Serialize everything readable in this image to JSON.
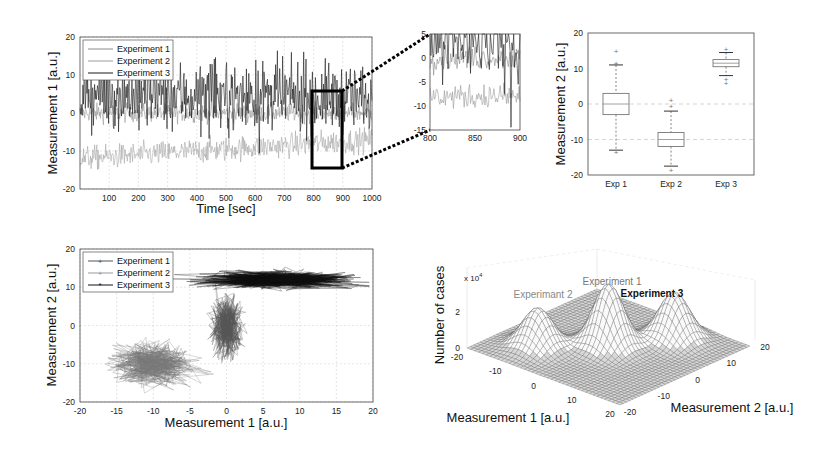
{
  "chart_data": [
    {
      "id": "timeseries",
      "type": "line",
      "title": "",
      "xlabel": "Time [sec]",
      "ylabel": "Measurement 1 [a.u.]",
      "xlim": [
        0,
        1000
      ],
      "ylim": [
        -20,
        20
      ],
      "xticks": [
        100,
        200,
        300,
        400,
        500,
        600,
        700,
        800,
        900,
        1000
      ],
      "yticks": [
        -20,
        -10,
        0,
        10,
        20
      ],
      "grid": true,
      "legend_position": "upper-left",
      "series": [
        {
          "name": "Experiment 1",
          "mean": 0,
          "noise": 1.2,
          "trend": 0,
          "color": "#8a8a8a"
        },
        {
          "name": "Experiment 2",
          "mean": -12,
          "noise": 1.6,
          "trend": 5,
          "color": "#9a9a9a"
        },
        {
          "name": "Experiment 3",
          "mean": 5,
          "noise": 4.5,
          "trend": -1,
          "color": "#1a1a1a"
        }
      ],
      "zoom_rectangle": {
        "x": [
          800,
          900
        ],
        "y": [
          -15,
          5
        ]
      }
    },
    {
      "id": "inset",
      "type": "line",
      "title": "",
      "xlim": [
        800,
        900
      ],
      "ylim": [
        -15,
        5
      ],
      "xticks": [
        800,
        850,
        900
      ],
      "yticks": [
        -15,
        -10,
        -5,
        0,
        5
      ],
      "grid": false,
      "series": [
        {
          "name": "Experiment 1",
          "mean": 0,
          "noise": 1.2,
          "color": "#8a8a8a"
        },
        {
          "name": "Experiment 2",
          "mean": -8,
          "noise": 1.3,
          "color": "#9a9a9a"
        },
        {
          "name": "Experiment 3",
          "mean": 4,
          "noise": 4.5,
          "color": "#1a1a1a"
        }
      ]
    },
    {
      "id": "boxplot",
      "type": "box",
      "xlabel": "",
      "ylabel": "Measurement 2 [a.u.]",
      "ylim": [
        -20,
        20
      ],
      "yticks": [
        -20,
        -10,
        0,
        10,
        20
      ],
      "categories": [
        "Exp 1",
        "Exp 2",
        "Exp 3"
      ],
      "boxes": [
        {
          "label": "Exp 1",
          "whisker_low": -13,
          "q1": -3,
          "median": 0,
          "q3": 3,
          "whisker_high": 11,
          "outliers": [
            15,
            11.5,
            -13.5
          ]
        },
        {
          "label": "Exp 2",
          "whisker_low": -17.5,
          "q1": -12,
          "median": -10,
          "q3": -8,
          "whisker_high": -2,
          "outliers": [
            1,
            -0.5,
            -18.5
          ]
        },
        {
          "label": "Exp 3",
          "whisker_low": 8,
          "q1": 10.5,
          "median": 11.5,
          "q3": 12.5,
          "whisker_high": 14.5,
          "outliers": [
            15.5,
            7,
            6
          ]
        }
      ],
      "grid": "dashed horizontal at 0 and -10"
    },
    {
      "id": "scatter",
      "type": "scatter",
      "xlabel": "Measurement 1 [a.u.]",
      "ylabel": "Measurement 2 [a.u.]",
      "xlim": [
        -20,
        20
      ],
      "ylim": [
        -20,
        20
      ],
      "xticks": [
        -20,
        -15,
        -10,
        -5,
        0,
        5,
        10,
        15,
        20
      ],
      "yticks": [
        -20,
        -10,
        0,
        10,
        20
      ],
      "grid": true,
      "legend_position": "upper-left",
      "series": [
        {
          "name": "Experiment 1",
          "cx": 0,
          "cy": 0,
          "sx": 1.0,
          "sy": 4,
          "color": "#555555"
        },
        {
          "name": "Experiment 2",
          "cx": -10,
          "cy": -10,
          "sx": 2.8,
          "sy": 2.8,
          "color": "#777777"
        },
        {
          "name": "Experiment 3",
          "cx": 7,
          "cy": 12,
          "sx": 5,
          "sy": 1.1,
          "color": "#111111"
        }
      ]
    },
    {
      "id": "histogram3d",
      "type": "surface",
      "xlabel": "Measurement 1 [a.u.]",
      "ylabel": "Measurement 2 [a.u.]",
      "zlabel": "Number of cases",
      "z_multiplier": "x 10^4",
      "xticks": [
        -20,
        -10,
        0,
        10,
        20
      ],
      "yticks": [
        -20,
        -10,
        0,
        10,
        20
      ],
      "zticks": [
        0,
        2
      ],
      "annotations": [
        {
          "text": "Experiment 1",
          "style": "gray"
        },
        {
          "text": "Experimant 2",
          "style": "gray"
        },
        {
          "text": "Experiment 3",
          "style": "bold"
        }
      ],
      "peaks": [
        {
          "name": "Experiment 1",
          "x": 0,
          "y": 0,
          "height": 3.5
        },
        {
          "name": "Experiment 2",
          "x": -10,
          "y": -10,
          "height": 2.2
        },
        {
          "name": "Experiment 3",
          "x": 7,
          "y": 12,
          "height": 2.6
        }
      ]
    }
  ],
  "labels": {
    "ts_xlabel": "Time [sec]",
    "ts_ylabel": "Measurement 1 [a.u.]",
    "box_ylabel": "Measurement 2 [a.u.]",
    "sc_xlabel": "Measurement 1 [a.u.]",
    "sc_ylabel": "Measurement 2 [a.u.]",
    "s3_xlabel": "Measurement 1 [a.u.]",
    "s3_ylabel": "Measurement 2 [a.u.]",
    "s3_zlabel": "Number of cases",
    "s3_mult": "x 10",
    "s3_mult_exp": "4",
    "s3_ann1": "Experiment 1",
    "s3_ann2": "Experimant 2",
    "s3_ann3": "Experiment 3",
    "legend": [
      "Experiment 1",
      "Experiment 2",
      "Experiment 3"
    ],
    "box_cats": [
      "Exp 1",
      "Exp 2",
      "Exp 3"
    ]
  }
}
